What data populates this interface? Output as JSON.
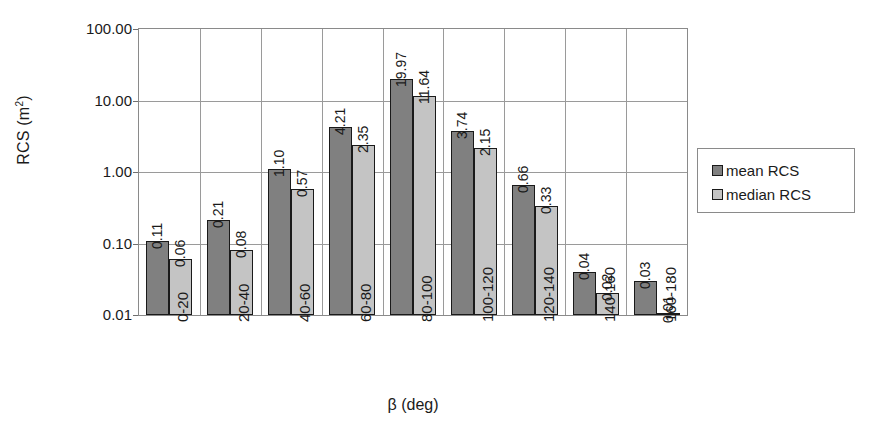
{
  "chart_data": {
    "type": "bar",
    "title": "",
    "xlabel": "β (deg)",
    "ylabel": "RCS (m²)",
    "ylabel_base": "RCS (m",
    "ylabel_sup": "2",
    "ylabel_close": ")",
    "yscale": "log",
    "ylim": [
      0.01,
      100
    ],
    "ytick_labels": [
      "100.00",
      "10.00",
      "1.00",
      "0.10",
      "0.01"
    ],
    "ytick_values": [
      100,
      10,
      1,
      0.1,
      0.01
    ],
    "grid": true,
    "legend_position": "right",
    "categories": [
      "0-20",
      "20-40",
      "40-60",
      "60-80",
      "80-100",
      "100-120",
      "120-140",
      "140-160",
      "160-180"
    ],
    "series": [
      {
        "name": "mean RCS",
        "color": "#808080",
        "values": [
          0.11,
          0.21,
          1.1,
          4.21,
          19.97,
          3.74,
          0.66,
          0.04,
          0.03
        ],
        "labels": [
          "0.11",
          "0.21",
          "1.10",
          "4.21",
          "19.97",
          "3.74",
          "0.66",
          "0.04",
          "0.03"
        ]
      },
      {
        "name": "median RCS",
        "color": "#c4c4c4",
        "values": [
          0.06,
          0.08,
          0.57,
          2.35,
          11.64,
          2.15,
          0.33,
          0.02,
          0.01
        ],
        "labels": [
          "0.06",
          "0.08",
          "0.57",
          "2.35",
          "11.64",
          "2.15",
          "0.33",
          "0.02",
          "0.01"
        ]
      }
    ]
  },
  "legend": {
    "items": [
      {
        "label": "mean RCS",
        "color": "#808080"
      },
      {
        "label": "median RCS",
        "color": "#c4c4c4"
      }
    ]
  }
}
